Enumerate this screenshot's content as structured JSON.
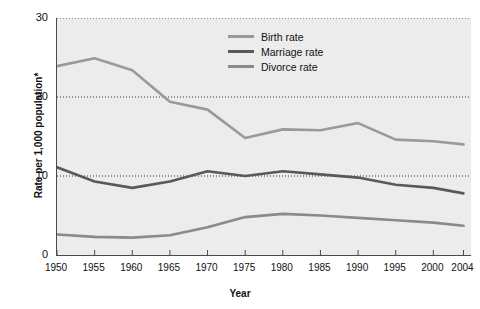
{
  "chart_data": {
    "type": "line",
    "title": "",
    "xlabel": "Year",
    "ylabel": "Rate per 1,000 population*",
    "x": [
      1950,
      1955,
      1960,
      1965,
      1970,
      1975,
      1980,
      1985,
      1990,
      1995,
      2000,
      2004
    ],
    "categories": [
      "1950",
      "1955",
      "1960",
      "1965",
      "1970",
      "1975",
      "1980",
      "1985",
      "1990",
      "1995",
      "2000",
      "2004"
    ],
    "xlim": [
      1950,
      2005
    ],
    "ylim": [
      0,
      30
    ],
    "yticks": [
      0,
      10,
      20,
      30
    ],
    "ytick_labels": [
      "0",
      "10",
      "20",
      "30"
    ],
    "grid": "horizontal-dotted",
    "legend_position": "top-right-inside",
    "plot_background": "#ececec",
    "series": [
      {
        "name": "Birth rate",
        "color": "#9a9a9a",
        "values": [
          23.9,
          24.9,
          23.4,
          19.4,
          18.4,
          14.8,
          15.9,
          15.8,
          16.7,
          14.6,
          14.4,
          14.0
        ]
      },
      {
        "name": "Marriage rate",
        "color": "#595959",
        "values": [
          11.1,
          9.3,
          8.5,
          9.3,
          10.6,
          10.0,
          10.6,
          10.2,
          9.8,
          8.9,
          8.5,
          7.8
        ]
      },
      {
        "name": "Divorce rate",
        "color": "#8a8a8a",
        "values": [
          2.6,
          2.3,
          2.2,
          2.5,
          3.5,
          4.8,
          5.2,
          5.0,
          4.7,
          4.4,
          4.1,
          3.7
        ]
      }
    ]
  },
  "legend": {
    "items": [
      {
        "label": "Birth rate",
        "color": "#9a9a9a"
      },
      {
        "label": "Marriage rate",
        "color": "#595959"
      },
      {
        "label": "Divorce rate",
        "color": "#8a8a8a"
      }
    ]
  },
  "axes": {
    "y_title": "Rate per 1,000 population*",
    "x_title": "Year"
  }
}
